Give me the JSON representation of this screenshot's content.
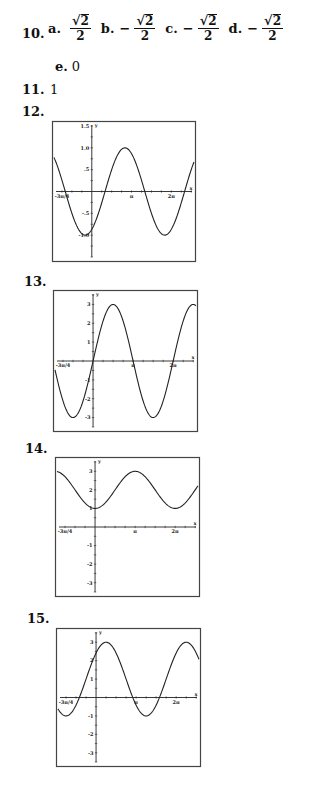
{
  "problem10": {
    "number": "10.",
    "options": [
      {
        "letter": "a.",
        "sign": "",
        "numerator": "2",
        "denominator": "2"
      },
      {
        "letter": "b.",
        "sign": "−",
        "numerator": "2",
        "denominator": "2"
      },
      {
        "letter": "c.",
        "sign": "−",
        "numerator": "2",
        "denominator": "2"
      },
      {
        "letter": "d.",
        "sign": "−",
        "numerator": "2",
        "denominator": "2"
      }
    ],
    "option_e": {
      "letter": "e.",
      "value": "0"
    }
  },
  "problem11": {
    "number": "11.",
    "answer": "1"
  },
  "problem12": {
    "number": "12."
  },
  "problem13": {
    "number": "13."
  },
  "problem14": {
    "number": "14."
  },
  "problem15": {
    "number": "15."
  },
  "chart_data": [
    {
      "id": "12",
      "type": "line",
      "function": "y = -cos(x + pi/6)",
      "xlabel": "x",
      "ylabel": "y",
      "xlim": [
        -0.95,
        2.57
      ],
      "x_unit": "pi",
      "ylim": [
        -1.5,
        1.5
      ],
      "x_tick_labels": [
        {
          "value": -0.75,
          "label": "-3π/4"
        },
        {
          "value": 1,
          "label": "π"
        },
        {
          "value": 2,
          "label": "2π"
        }
      ],
      "y_tick_labels": [
        {
          "value": 1.5,
          "label": "1.5"
        },
        {
          "value": 1.0,
          "label": "1.0"
        },
        {
          "value": 0.5,
          "label": ".5"
        },
        {
          "value": -0.5,
          "label": "-.5"
        },
        {
          "value": -1.0,
          "label": "-1.0"
        }
      ],
      "y_tick_step": 0.25,
      "x_tick_step": 0.25,
      "coeffs": {
        "kind": "cos",
        "A": -1,
        "phase": 0.16667,
        "D": 0
      },
      "grid": false
    },
    {
      "id": "13",
      "type": "line",
      "function": "y = 3 sin(x)",
      "xlabel": "x",
      "ylabel": "y",
      "xlim": [
        -0.95,
        2.57
      ],
      "x_unit": "pi",
      "ylim": [
        -3.5,
        3.5
      ],
      "x_tick_labels": [
        {
          "value": -0.75,
          "label": "-3π/4"
        },
        {
          "value": 1,
          "label": "π"
        },
        {
          "value": 2,
          "label": "2π"
        }
      ],
      "y_tick_labels": [
        {
          "value": 3,
          "label": "3"
        },
        {
          "value": 2,
          "label": "2"
        },
        {
          "value": 1,
          "label": "1"
        },
        {
          "value": -1,
          "label": "-1"
        },
        {
          "value": -2,
          "label": "-2"
        },
        {
          "value": -3,
          "label": "-3"
        }
      ],
      "y_tick_step": 0.5,
      "x_tick_step": 0.25,
      "coeffs": {
        "kind": "sin",
        "A": 3,
        "phase": 0,
        "D": 0
      },
      "grid": false
    },
    {
      "id": "14",
      "type": "line",
      "function": "y = 2 - cos(x)",
      "xlabel": "x",
      "ylabel": "y",
      "xlim": [
        -0.95,
        2.57
      ],
      "x_unit": "pi",
      "ylim": [
        -3.5,
        3.5
      ],
      "x_tick_labels": [
        {
          "value": -0.75,
          "label": "-3π/4"
        },
        {
          "value": 1,
          "label": "π"
        },
        {
          "value": 2,
          "label": "2π"
        }
      ],
      "y_tick_labels": [
        {
          "value": 3,
          "label": "3"
        },
        {
          "value": 2,
          "label": "2"
        },
        {
          "value": 1,
          "label": "1"
        },
        {
          "value": -1,
          "label": "-1"
        },
        {
          "value": -2,
          "label": "-2"
        },
        {
          "value": -3,
          "label": "-3"
        }
      ],
      "y_tick_step": 0.5,
      "x_tick_step": 0.25,
      "coeffs": {
        "kind": "cos",
        "A": -1,
        "phase": 0,
        "D": 2
      },
      "grid": false
    },
    {
      "id": "15",
      "type": "line",
      "function": "y = 1 + 2 sin(x + pi/4)",
      "xlabel": "x",
      "ylabel": "y",
      "xlim": [
        -0.95,
        2.57
      ],
      "x_unit": "pi",
      "ylim": [
        -3.5,
        3.5
      ],
      "x_tick_labels": [
        {
          "value": -0.75,
          "label": "-3π/4"
        },
        {
          "value": 1,
          "label": "π"
        },
        {
          "value": 2,
          "label": "2π"
        }
      ],
      "y_tick_labels": [
        {
          "value": 3,
          "label": "3"
        },
        {
          "value": 2,
          "label": "2"
        },
        {
          "value": 1,
          "label": "1"
        },
        {
          "value": -1,
          "label": "-1"
        },
        {
          "value": -2,
          "label": "-2"
        },
        {
          "value": -3,
          "label": "-3"
        }
      ],
      "y_tick_step": 0.5,
      "x_tick_step": 0.25,
      "coeffs": {
        "kind": "sin",
        "A": 2,
        "phase": 0.25,
        "D": 1
      },
      "grid": false
    }
  ]
}
